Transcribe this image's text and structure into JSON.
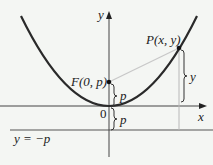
{
  "diagram": {
    "labels": {
      "y_axis": "y",
      "x_axis": "x",
      "origin": "0",
      "focus": "F(0, p)",
      "point": "P(x, y)",
      "directrix": "y = −p",
      "brace_focus": "p",
      "brace_directrix": "p",
      "brace_point": "y"
    },
    "colors": {
      "background": "#f4f6f3",
      "curve": "#2a2a2a",
      "axes": "#444444",
      "focus_segment": "#c8c8c8",
      "guide_line": "#b8b8b8"
    },
    "geometry": {
      "origin_px": [
        109,
        106
      ],
      "focus_px": [
        109,
        82
      ],
      "point_px": [
        179,
        48
      ],
      "directrix_y_px": 130
    }
  }
}
